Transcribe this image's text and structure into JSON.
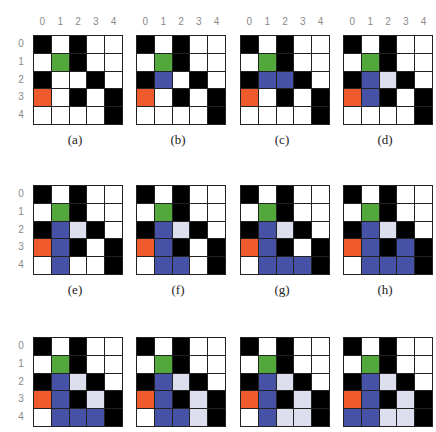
{
  "colors": {
    "W": "#ffffff",
    "B": "#000000",
    "G": "#52a83a",
    "O": "#ef5a2c",
    "U": "#4552a6",
    "L": "#dedfee"
  },
  "legend_note": "W=white(open), B=black(wall), G=green(start), O=orange(goal), U=blue(visited/path), L=light lavender(frontier)",
  "column_labels": [
    "0",
    "1",
    "2",
    "3",
    "4"
  ],
  "row_labels": [
    "0",
    "1",
    "2",
    "3",
    "4"
  ],
  "panels": [
    {
      "caption": "(a)",
      "grid": [
        [
          "B",
          "W",
          "B",
          "W",
          "W"
        ],
        [
          "W",
          "G",
          "B",
          "W",
          "W"
        ],
        [
          "B",
          "W",
          "W",
          "B",
          "W"
        ],
        [
          "O",
          "W",
          "B",
          "W",
          "B"
        ],
        [
          "W",
          "W",
          "W",
          "W",
          "B"
        ]
      ]
    },
    {
      "caption": "(b)",
      "grid": [
        [
          "B",
          "W",
          "B",
          "W",
          "W"
        ],
        [
          "W",
          "G",
          "B",
          "W",
          "W"
        ],
        [
          "B",
          "U",
          "W",
          "B",
          "W"
        ],
        [
          "O",
          "W",
          "B",
          "W",
          "B"
        ],
        [
          "W",
          "W",
          "W",
          "W",
          "B"
        ]
      ]
    },
    {
      "caption": "(c)",
      "grid": [
        [
          "B",
          "W",
          "B",
          "W",
          "W"
        ],
        [
          "W",
          "G",
          "B",
          "W",
          "W"
        ],
        [
          "B",
          "U",
          "U",
          "B",
          "W"
        ],
        [
          "O",
          "W",
          "B",
          "W",
          "B"
        ],
        [
          "W",
          "W",
          "W",
          "W",
          "B"
        ]
      ]
    },
    {
      "caption": "(d)",
      "grid": [
        [
          "B",
          "W",
          "B",
          "W",
          "W"
        ],
        [
          "W",
          "G",
          "B",
          "W",
          "W"
        ],
        [
          "B",
          "U",
          "L",
          "B",
          "W"
        ],
        [
          "O",
          "U",
          "B",
          "W",
          "B"
        ],
        [
          "W",
          "W",
          "W",
          "W",
          "B"
        ]
      ]
    },
    {
      "caption": "(e)",
      "grid": [
        [
          "B",
          "W",
          "B",
          "W",
          "W"
        ],
        [
          "W",
          "G",
          "B",
          "W",
          "W"
        ],
        [
          "B",
          "U",
          "L",
          "B",
          "W"
        ],
        [
          "O",
          "U",
          "B",
          "W",
          "B"
        ],
        [
          "W",
          "U",
          "W",
          "W",
          "B"
        ]
      ]
    },
    {
      "caption": "(f)",
      "grid": [
        [
          "B",
          "W",
          "B",
          "W",
          "W"
        ],
        [
          "W",
          "G",
          "B",
          "W",
          "W"
        ],
        [
          "B",
          "U",
          "L",
          "B",
          "W"
        ],
        [
          "O",
          "U",
          "B",
          "W",
          "B"
        ],
        [
          "W",
          "U",
          "U",
          "W",
          "B"
        ]
      ]
    },
    {
      "caption": "(g)",
      "grid": [
        [
          "B",
          "W",
          "B",
          "W",
          "W"
        ],
        [
          "W",
          "G",
          "B",
          "W",
          "W"
        ],
        [
          "B",
          "U",
          "L",
          "B",
          "W"
        ],
        [
          "O",
          "U",
          "B",
          "W",
          "B"
        ],
        [
          "W",
          "U",
          "U",
          "U",
          "B"
        ]
      ]
    },
    {
      "caption": "(h)",
      "grid": [
        [
          "B",
          "W",
          "B",
          "W",
          "W"
        ],
        [
          "W",
          "G",
          "B",
          "W",
          "W"
        ],
        [
          "B",
          "U",
          "L",
          "B",
          "W"
        ],
        [
          "O",
          "U",
          "B",
          "U",
          "B"
        ],
        [
          "W",
          "U",
          "U",
          "U",
          "B"
        ]
      ]
    },
    {
      "caption": "(i)",
      "grid": [
        [
          "B",
          "W",
          "B",
          "W",
          "W"
        ],
        [
          "W",
          "G",
          "B",
          "W",
          "W"
        ],
        [
          "B",
          "U",
          "L",
          "B",
          "W"
        ],
        [
          "O",
          "U",
          "B",
          "L",
          "B"
        ],
        [
          "W",
          "U",
          "U",
          "U",
          "B"
        ]
      ]
    },
    {
      "caption": "(j)",
      "grid": [
        [
          "B",
          "W",
          "B",
          "W",
          "W"
        ],
        [
          "W",
          "G",
          "B",
          "W",
          "W"
        ],
        [
          "B",
          "U",
          "L",
          "B",
          "W"
        ],
        [
          "O",
          "U",
          "B",
          "L",
          "B"
        ],
        [
          "W",
          "U",
          "U",
          "L",
          "B"
        ]
      ]
    },
    {
      "caption": "(k)",
      "grid": [
        [
          "B",
          "W",
          "B",
          "W",
          "W"
        ],
        [
          "W",
          "G",
          "B",
          "W",
          "W"
        ],
        [
          "B",
          "U",
          "L",
          "B",
          "W"
        ],
        [
          "O",
          "U",
          "B",
          "L",
          "B"
        ],
        [
          "W",
          "U",
          "L",
          "L",
          "B"
        ]
      ]
    },
    {
      "caption": "(l)",
      "grid": [
        [
          "B",
          "W",
          "B",
          "W",
          "W"
        ],
        [
          "W",
          "G",
          "B",
          "W",
          "W"
        ],
        [
          "B",
          "U",
          "L",
          "B",
          "W"
        ],
        [
          "O",
          "U",
          "B",
          "L",
          "B"
        ],
        [
          "U",
          "U",
          "L",
          "L",
          "B"
        ]
      ]
    }
  ],
  "layout": {
    "col_x": [
      33,
      136,
      240,
      343
    ],
    "row_y": [
      35,
      185,
      337
    ],
    "column_labels_row": 0
  }
}
